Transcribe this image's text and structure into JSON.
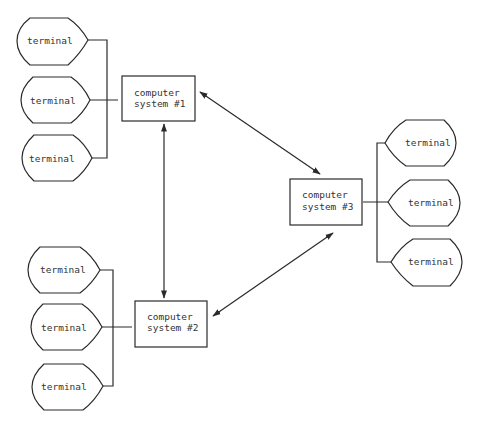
{
  "diagram": {
    "type": "network-topology",
    "systems": [
      {
        "id": "sys1",
        "line1": "computer",
        "line2": "system #1"
      },
      {
        "id": "sys2",
        "line1": "computer",
        "line2": "system #2"
      },
      {
        "id": "sys3",
        "line1": "computer",
        "line2": "system #3"
      }
    ],
    "terminal_groups": {
      "sys1": [
        "terminal",
        "terminal",
        "terminal"
      ],
      "sys2": [
        "terminal",
        "terminal",
        "terminal"
      ],
      "sys3": [
        "terminal",
        "terminal",
        "terminal"
      ]
    },
    "links": [
      {
        "from": "sys1",
        "to": "sys3",
        "direction": "bidirectional"
      },
      {
        "from": "sys1",
        "to": "sys2",
        "direction": "bidirectional"
      },
      {
        "from": "sys2",
        "to": "sys3",
        "direction": "bidirectional"
      }
    ],
    "colors": {
      "stroke": "#2a2a2a",
      "text": "#333333",
      "background": "#ffffff"
    }
  }
}
